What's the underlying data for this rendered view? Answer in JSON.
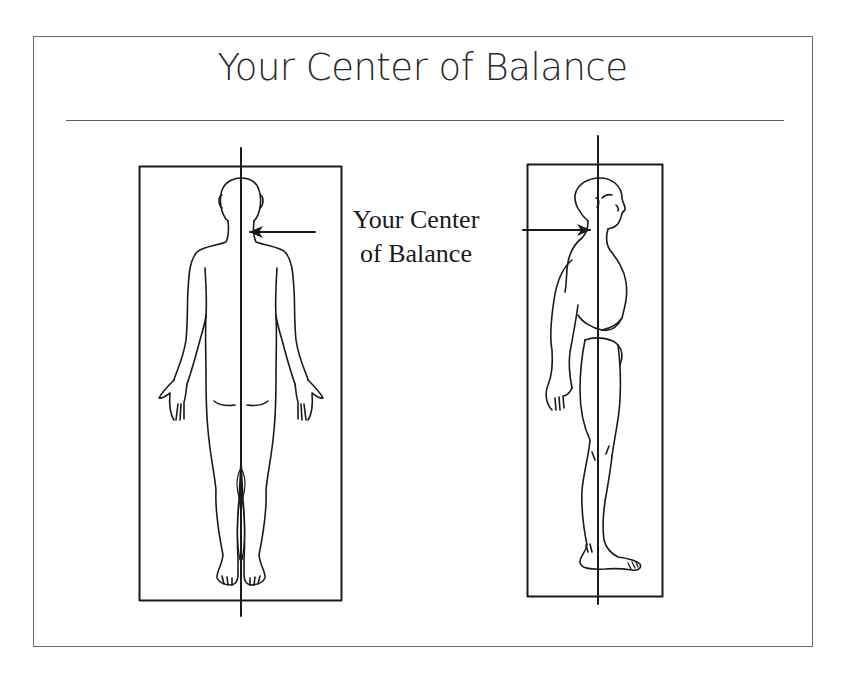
{
  "slide": {
    "title": "Your Center of Balance",
    "annotation": {
      "line1": "Your Center",
      "line2": "of Balance"
    }
  },
  "figures": [
    {
      "view": "posterior",
      "description": "Human figure viewed from the back inside a rectangle with a vertical plumb line and an arrow pointing to the base of the neck"
    },
    {
      "view": "lateral",
      "description": "Human figure viewed from the side inside a rectangle with a vertical plumb line and an arrow pointing to the base of the neck"
    }
  ],
  "colors": {
    "line": "#1a1a1a",
    "frame": "#6a6a6a",
    "background": "#ffffff"
  }
}
